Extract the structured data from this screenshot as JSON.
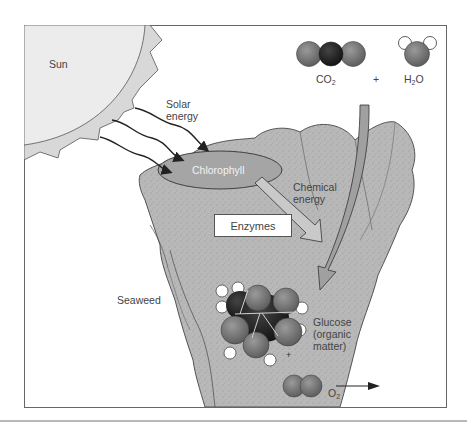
{
  "figure": {
    "labels": {
      "sun": "Sun",
      "solar_energy_line1": "Solar",
      "solar_energy_line2": "energy",
      "chlorophyll": "Chlorophyll",
      "chemical_energy_line1": "Chemical",
      "chemical_energy_line2": "energy",
      "enzymes": "Enzymes",
      "seaweed": "Seaweed",
      "glucose_line1": "Glucose",
      "glucose_line2": "(organic",
      "glucose_line3": "matter)",
      "plus_reactants": "+",
      "plus_products": "+"
    },
    "formulas": {
      "co2": {
        "base": "CO",
        "sub": "2"
      },
      "h2o": {
        "base_pre": "H",
        "sub": "2",
        "base_post": "O"
      },
      "o2": {
        "base": "O",
        "sub": "2"
      }
    },
    "colors": {
      "sun_fill": "#ececec",
      "sun_corona": "#d6d6d6",
      "seaweed_fill": "#b5b5b5",
      "seaweed_dark": "#9c9c9c",
      "chlorophyll_fill": "#a6a6a6",
      "oxygen_atom": "#7a7a7a",
      "carbon_atom": "#2a2a2a",
      "hydrogen_atom": "#ffffff",
      "arrow_fill": "#a3a3a3",
      "frame": "#666666"
    }
  }
}
